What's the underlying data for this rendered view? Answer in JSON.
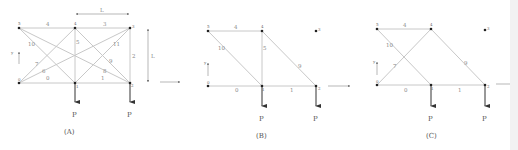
{
  "figure": {
    "panels": [
      {
        "id": "A",
        "caption": "(A)",
        "load_label": "P",
        "dimension_labels": {
          "horizontal": "L",
          "vertical": "L"
        },
        "nodes": [
          {
            "id": "0",
            "x": 19,
            "y": 83
          },
          {
            "id": "1",
            "x": 75,
            "y": 83
          },
          {
            "id": "2",
            "x": 130,
            "y": 83
          },
          {
            "id": "3",
            "x": 130,
            "y": 28
          },
          {
            "id": "4",
            "x": 75,
            "y": 28
          },
          {
            "id": "5",
            "x": 19,
            "y": 28
          }
        ],
        "members": [
          {
            "label": "0",
            "from": "0",
            "to": "1"
          },
          {
            "label": "1",
            "from": "1",
            "to": "2"
          },
          {
            "label": "2",
            "from": "2",
            "to": "3"
          },
          {
            "label": "3",
            "from": "3",
            "to": "4"
          },
          {
            "label": "4",
            "from": "4",
            "to": "5"
          },
          {
            "label": "5",
            "from": "4",
            "to": "1"
          },
          {
            "label": "6",
            "from": "0",
            "to": "3"
          },
          {
            "label": "7",
            "from": "0",
            "to": "4"
          },
          {
            "label": "8",
            "from": "5",
            "to": "2"
          },
          {
            "label": "9",
            "from": "4",
            "to": "2"
          },
          {
            "label": "10",
            "from": "5",
            "to": "1"
          },
          {
            "label": "11",
            "from": "1",
            "to": "3"
          }
        ]
      },
      {
        "id": "B",
        "caption": "(B)",
        "load_label": "P",
        "nodes": [
          {
            "id": "0",
            "x": 208,
            "y": 86
          },
          {
            "id": "1",
            "x": 262,
            "y": 86
          },
          {
            "id": "2",
            "x": 316,
            "y": 86
          },
          {
            "id": "3",
            "x": 316,
            "y": 31
          },
          {
            "id": "4",
            "x": 262,
            "y": 31
          },
          {
            "id": "5",
            "x": 208,
            "y": 31
          }
        ],
        "members": [
          {
            "label": "0",
            "from": "0",
            "to": "1"
          },
          {
            "label": "1",
            "from": "1",
            "to": "2"
          },
          {
            "label": "4",
            "from": "4",
            "to": "5"
          },
          {
            "label": "5",
            "from": "4",
            "to": "1"
          },
          {
            "label": "9",
            "from": "4",
            "to": "2"
          },
          {
            "label": "10",
            "from": "5",
            "to": "1"
          }
        ]
      },
      {
        "id": "C",
        "caption": "(C)",
        "load_label": "P",
        "nodes": [
          {
            "id": "0",
            "x": 377,
            "y": 85
          },
          {
            "id": "1",
            "x": 431,
            "y": 85
          },
          {
            "id": "2",
            "x": 485,
            "y": 85
          },
          {
            "id": "3",
            "x": 485,
            "y": 29
          },
          {
            "id": "4",
            "x": 431,
            "y": 29
          },
          {
            "id": "5",
            "x": 377,
            "y": 29
          }
        ],
        "members": [
          {
            "label": "0",
            "from": "0",
            "to": "1"
          },
          {
            "label": "1",
            "from": "1",
            "to": "2"
          },
          {
            "label": "4",
            "from": "4",
            "to": "5"
          },
          {
            "label": "7",
            "from": "0",
            "to": "4"
          },
          {
            "label": "9",
            "from": "4",
            "to": "2"
          },
          {
            "label": "10",
            "from": "5",
            "to": "1"
          }
        ]
      }
    ],
    "axes": {
      "x_label": "x",
      "y_label": "y"
    }
  }
}
